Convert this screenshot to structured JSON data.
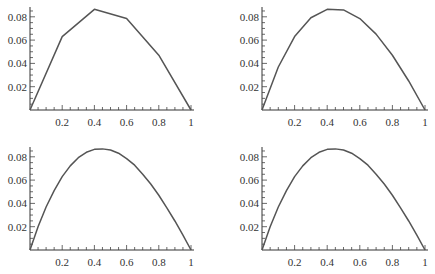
{
  "chart_data": [
    {
      "type": "line",
      "title": "",
      "panel": "top-left",
      "xlabel": "",
      "ylabel": "",
      "xlim": [
        0,
        1
      ],
      "ylim": [
        0,
        0.088
      ],
      "x_ticks": [
        "0.2",
        "0.4",
        "0.6",
        "0.8",
        "1"
      ],
      "y_ticks": [
        "0.02",
        "0.04",
        "0.06",
        "0.08"
      ],
      "x": [
        0,
        0.2,
        0.4,
        0.6,
        0.8,
        1.0
      ],
      "values": [
        0,
        0.063,
        0.0864,
        0.0785,
        0.047,
        0
      ],
      "grid": false
    },
    {
      "type": "line",
      "title": "",
      "panel": "top-right",
      "xlabel": "",
      "ylabel": "",
      "xlim": [
        0,
        1
      ],
      "ylim": [
        0,
        0.088
      ],
      "x_ticks": [
        "0.2",
        "0.4",
        "0.6",
        "0.8",
        "1"
      ],
      "y_ticks": [
        "0.02",
        "0.04",
        "0.06",
        "0.08"
      ],
      "x": [
        0,
        0.1,
        0.2,
        0.3,
        0.4,
        0.5,
        0.6,
        0.7,
        0.8,
        0.9,
        1.0
      ],
      "values": [
        0,
        0.0369,
        0.063,
        0.0792,
        0.0864,
        0.0859,
        0.0785,
        0.0651,
        0.047,
        0.0249,
        0
      ],
      "grid": false
    },
    {
      "type": "line",
      "title": "",
      "panel": "bottom-left",
      "xlabel": "",
      "ylabel": "",
      "xlim": [
        0,
        1
      ],
      "ylim": [
        0,
        0.088
      ],
      "x_ticks": [
        "0.2",
        "0.4",
        "0.6",
        "0.8",
        "1"
      ],
      "y_ticks": [
        "0.02",
        "0.04",
        "0.06",
        "0.08"
      ],
      "x": [
        0,
        0.05,
        0.1,
        0.15,
        0.2,
        0.25,
        0.3,
        0.35,
        0.4,
        0.45,
        0.5,
        0.55,
        0.6,
        0.65,
        0.7,
        0.75,
        0.8,
        0.85,
        0.9,
        0.95,
        1.0
      ],
      "values": [
        0,
        0.0199,
        0.0369,
        0.051,
        0.063,
        0.0722,
        0.0792,
        0.0839,
        0.0864,
        0.0868,
        0.0859,
        0.0831,
        0.0785,
        0.0728,
        0.0651,
        0.0566,
        0.047,
        0.0362,
        0.0249,
        0.0128,
        0
      ],
      "grid": false
    },
    {
      "type": "line",
      "title": "",
      "panel": "bottom-right",
      "xlabel": "",
      "ylabel": "",
      "xlim": [
        0,
        1
      ],
      "ylim": [
        0,
        0.088
      ],
      "x_ticks": [
        "0.2",
        "0.4",
        "0.6",
        "0.8",
        "1"
      ],
      "y_ticks": [
        "0.02",
        "0.04",
        "0.06",
        "0.08"
      ],
      "x": [
        0,
        0.05,
        0.1,
        0.15,
        0.2,
        0.25,
        0.3,
        0.35,
        0.4,
        0.45,
        0.5,
        0.55,
        0.6,
        0.65,
        0.7,
        0.75,
        0.8,
        0.85,
        0.9,
        0.95,
        1.0
      ],
      "values": [
        0,
        0.0199,
        0.0369,
        0.051,
        0.063,
        0.0722,
        0.0792,
        0.0839,
        0.0864,
        0.0868,
        0.0859,
        0.0831,
        0.0785,
        0.0728,
        0.0651,
        0.0566,
        0.047,
        0.0362,
        0.0249,
        0.0128,
        0
      ],
      "grid": false
    }
  ],
  "layout": {
    "panels": [
      {
        "x0": 30,
        "x1": 191,
        "y0": 110,
        "ymax_px": 7
      },
      {
        "x0": 262,
        "x1": 425,
        "y0": 110,
        "ymax_px": 7
      },
      {
        "x0": 30,
        "x1": 191,
        "y0": 250,
        "ymax_px": 147
      },
      {
        "x0": 262,
        "x1": 425,
        "y0": 250,
        "ymax_px": 147
      }
    ],
    "y_unit_px_per_0_01": 11.65,
    "colors": {
      "axis": "#333333",
      "curve": "#555555",
      "text": "#333333"
    }
  }
}
